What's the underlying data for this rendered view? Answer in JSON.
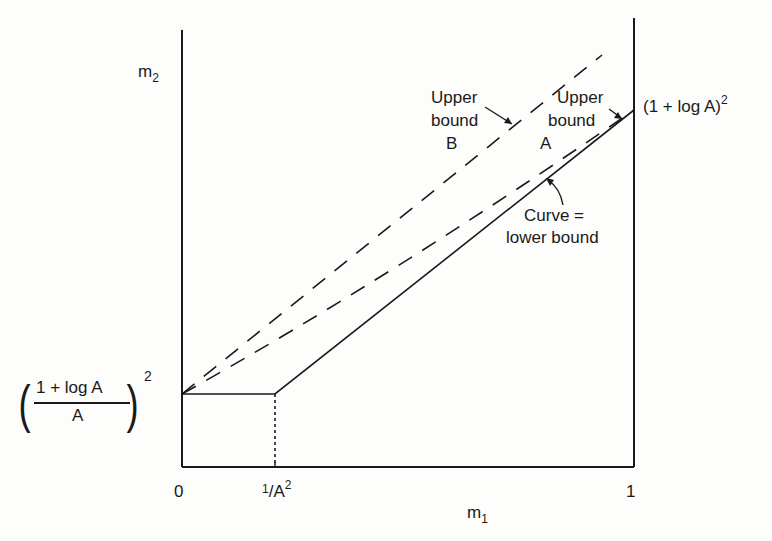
{
  "figure": {
    "y_axis_label": "m",
    "y_axis_label_sub": "2",
    "x_axis_label": "m",
    "x_axis_label_sub": "1",
    "x_ticks": {
      "zero": "0",
      "inv_a2_num": "1",
      "inv_a2_den": "A",
      "inv_a2_sup": "2",
      "one": "1"
    },
    "top_right_value": "(1 + log A)",
    "top_right_sup": "2",
    "left_value": {
      "open": "(",
      "numerator": "1 + log A",
      "denominator": "A",
      "close": ")",
      "sup": "2"
    },
    "annotations": {
      "upper_bound_b": [
        "Upper",
        "bound",
        "B"
      ],
      "upper_bound_a": [
        "Upper",
        "bound",
        "A"
      ],
      "curve_lower": [
        "Curve =",
        "lower bound"
      ]
    },
    "colors": {
      "ink": "#1a1a1a",
      "background": "#fdfdfc"
    }
  }
}
